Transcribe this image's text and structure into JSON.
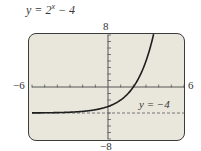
{
  "chart_data": {
    "type": "line",
    "title_parts": {
      "lhs": "y = 2",
      "exp": "x",
      "rhs": " − 4"
    },
    "function": "2^x - 4",
    "xlim": [
      -6,
      6
    ],
    "ylim": [
      -8,
      8
    ],
    "xtick_step": 1,
    "ytick_step": 1,
    "tick_labels": {
      "xmin": "−6",
      "xmax": "6",
      "ymin": "−8",
      "ymax": "8"
    },
    "asymptote": {
      "y": -4,
      "label": "y = −4",
      "style": "dashed"
    },
    "series": [
      {
        "name": "y = 2^x − 4",
        "x": [
          -6,
          -5,
          -4,
          -3,
          -2,
          -1,
          0,
          1,
          2,
          3,
          3.58
        ],
        "y": [
          -3.98,
          -3.97,
          -3.94,
          -3.88,
          -3.75,
          -3.5,
          -3,
          -2,
          0,
          4,
          8
        ]
      }
    ],
    "grid": false,
    "colors": {
      "background": "#e9e7dc",
      "curve": "#1e1e1e",
      "axis": "#555555",
      "asymptote": "#666666"
    }
  }
}
